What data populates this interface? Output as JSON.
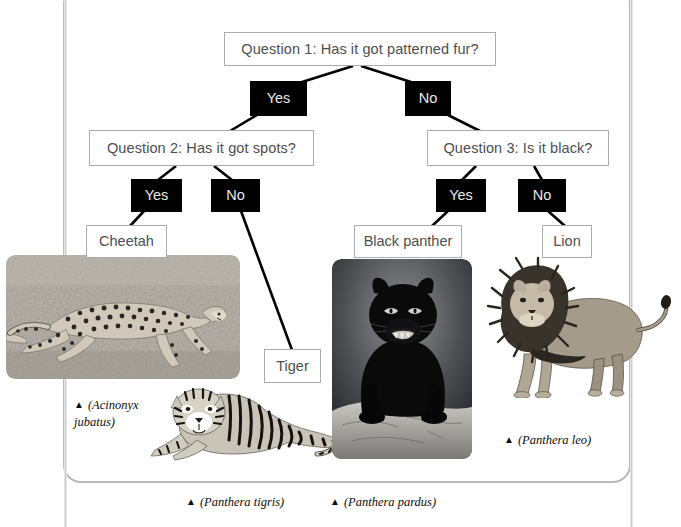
{
  "diagram": {
    "type": "decision-tree",
    "nodes": {
      "q1": {
        "label": "Question 1: Has it got patterned fur?"
      },
      "q1_yes": {
        "label": "Yes"
      },
      "q1_no": {
        "label": "No"
      },
      "q2": {
        "label": "Question 2: Has it got spots?"
      },
      "q2_yes": {
        "label": "Yes"
      },
      "q2_no": {
        "label": "No"
      },
      "q3": {
        "label": "Question 3: Is it black?"
      },
      "q3_yes": {
        "label": "Yes"
      },
      "q3_no": {
        "label": "No"
      },
      "cheetah": {
        "label": "Cheetah"
      },
      "tiger": {
        "label": "Tiger"
      },
      "panther": {
        "label": "Black panther"
      },
      "lion": {
        "label": "Lion"
      }
    }
  },
  "captions": {
    "cheetah": "(Acinonyx\njubatus)",
    "tiger": "(Panthera tigris)",
    "panther": "(Panthera pardus)",
    "lion": "(Panthera leo)",
    "marker": "▲"
  },
  "photos": {
    "cheetah": {
      "alt": "cheetah-running-photo"
    },
    "tiger": {
      "alt": "tiger-lying-photo"
    },
    "panther": {
      "alt": "black-panther-on-rock-photo"
    },
    "lion": {
      "alt": "lion-standing-photo"
    }
  },
  "colors": {
    "answer_box_fill": "#000000",
    "answer_box_text": "#e9eaea",
    "question_box_border": "#a9abad",
    "question_box_text": "#4c4e50",
    "frame_border": "#b7b9bb",
    "connector": "#000000"
  }
}
